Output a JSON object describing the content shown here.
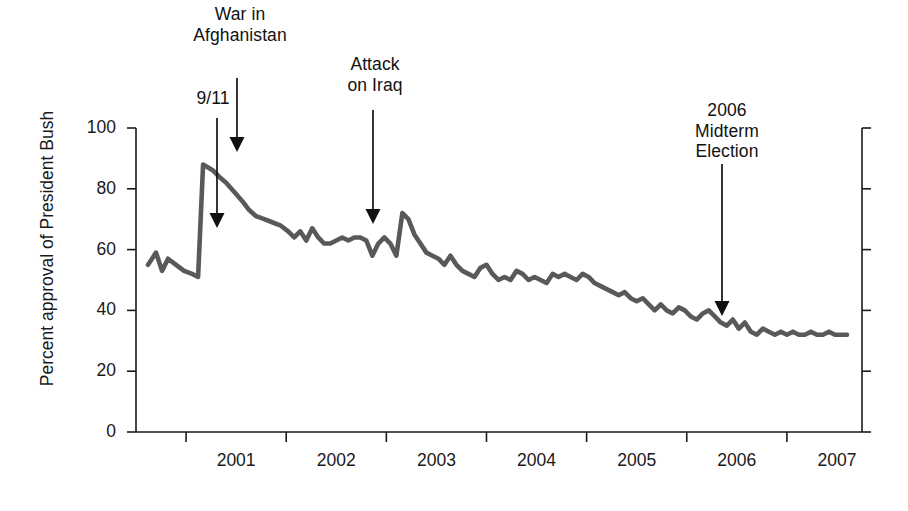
{
  "chart_data": {
    "type": "line",
    "title": "",
    "xlabel": "",
    "ylabel": "Percent approval of President Bush",
    "ylim": [
      0,
      100
    ],
    "yticks": [
      0,
      20,
      40,
      60,
      80,
      100
    ],
    "ytick_labels": [
      "0",
      "20",
      "40",
      "60",
      "80",
      "100"
    ],
    "xlim": [
      2000.5,
      2007.75
    ],
    "xtick_labels": [
      "2001",
      "2002",
      "2003",
      "2004",
      "2005",
      "2006",
      "2007"
    ],
    "xtick_values": [
      2001,
      2002,
      2003,
      2004,
      2005,
      2006,
      2007
    ],
    "grid": false,
    "legend": "none",
    "line_color": "#595959",
    "axis_color": "#1a1a1a",
    "series": [
      {
        "name": "Percent approval of President Bush",
        "x": [
          2000.62,
          2000.7,
          2000.76,
          2000.82,
          2000.9,
          2000.98,
          2001.06,
          2001.12,
          2001.17,
          2001.22,
          2001.27,
          2001.33,
          2001.4,
          2001.48,
          2001.56,
          2001.63,
          2001.7,
          2001.78,
          2001.86,
          2001.94,
          2002.02,
          2002.08,
          2002.14,
          2002.2,
          2002.26,
          2002.32,
          2002.38,
          2002.44,
          2002.5,
          2002.56,
          2002.62,
          2002.68,
          2002.74,
          2002.8,
          2002.86,
          2002.92,
          2002.98,
          2003.04,
          2003.1,
          2003.16,
          2003.22,
          2003.28,
          2003.34,
          2003.4,
          2003.46,
          2003.52,
          2003.58,
          2003.64,
          2003.7,
          2003.76,
          2003.82,
          2003.88,
          2003.94,
          2004.0,
          2004.06,
          2004.12,
          2004.18,
          2004.24,
          2004.3,
          2004.36,
          2004.42,
          2004.48,
          2004.54,
          2004.6,
          2004.66,
          2004.72,
          2004.78,
          2004.84,
          2004.9,
          2004.96,
          2005.02,
          2005.08,
          2005.14,
          2005.2,
          2005.26,
          2005.32,
          2005.38,
          2005.44,
          2005.5,
          2005.56,
          2005.62,
          2005.68,
          2005.74,
          2005.8,
          2005.86,
          2005.92,
          2005.98,
          2006.04,
          2006.1,
          2006.16,
          2006.22,
          2006.28,
          2006.34,
          2006.4,
          2006.46,
          2006.52,
          2006.58,
          2006.64,
          2006.7,
          2006.76,
          2006.82,
          2006.88,
          2006.94,
          2007.0,
          2007.06,
          2007.12,
          2007.18,
          2007.24,
          2007.3,
          2007.36,
          2007.42,
          2007.48,
          2007.54,
          2007.6
        ],
        "y": [
          55,
          59,
          53,
          57,
          55,
          53,
          52,
          51,
          88,
          87,
          86,
          84,
          82,
          79,
          76,
          73,
          71,
          70,
          69,
          68,
          66,
          64,
          66,
          63,
          67,
          64,
          62,
          62,
          63,
          64,
          63,
          64,
          64,
          63,
          58,
          62,
          64,
          62,
          58,
          72,
          70,
          65,
          62,
          59,
          58,
          57,
          55,
          58,
          55,
          53,
          52,
          51,
          54,
          55,
          52,
          50,
          51,
          50,
          53,
          52,
          50,
          51,
          50,
          49,
          52,
          51,
          52,
          51,
          50,
          52,
          51,
          49,
          48,
          47,
          46,
          45,
          46,
          44,
          43,
          44,
          42,
          40,
          42,
          40,
          39,
          41,
          40,
          38,
          37,
          39,
          40,
          38,
          36,
          35,
          37,
          34,
          36,
          33,
          32,
          34,
          33,
          32,
          33,
          32,
          33,
          32,
          32,
          33,
          32,
          32,
          33,
          32,
          32,
          32
        ]
      }
    ],
    "annotations": [
      {
        "id": "afghanistan",
        "label": "War in\nAfghanistan",
        "arrow_x": 237,
        "arrow_top": 78,
        "arrow_tip_y": 152
      },
      {
        "id": "september-eleven",
        "label": "9/11",
        "arrow_x": 217,
        "arrow_top": 118,
        "arrow_tip_y": 228
      },
      {
        "id": "iraq",
        "label": "Attack\non Iraq",
        "arrow_x": 373,
        "arrow_top": 110,
        "arrow_tip_y": 224
      },
      {
        "id": "midterm",
        "label": "2006\nMidterm\nElection",
        "arrow_x": 722,
        "arrow_top": 164,
        "arrow_tip_y": 316
      }
    ]
  }
}
